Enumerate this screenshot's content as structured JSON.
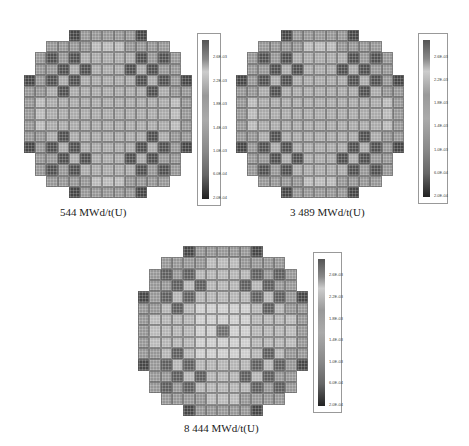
{
  "figure": {
    "panels": [
      {
        "caption": "544 MWd/t(U)",
        "burnup": 544,
        "core": {
          "x": 24,
          "y": 30,
          "size": 168
        },
        "colorbar": {
          "x": 197,
          "y": 33,
          "w": 24,
          "h": 173
        },
        "caption_pos": {
          "x": 60,
          "y": 206
        }
      },
      {
        "caption": "3 489 MWd/t(U)",
        "burnup": 3489,
        "core": {
          "x": 236,
          "y": 30,
          "size": 168
        },
        "colorbar": {
          "x": 418,
          "y": 33,
          "w": 30,
          "h": 171
        },
        "caption_pos": {
          "x": 290,
          "y": 206
        }
      },
      {
        "caption": "8 444  MWd/t(U)",
        "burnup": 8444,
        "core": {
          "x": 138,
          "y": 246,
          "size": 170
        },
        "colorbar": {
          "x": 313,
          "y": 252,
          "w": 29,
          "h": 161
        },
        "caption_pos": {
          "x": 184,
          "y": 422
        }
      }
    ],
    "colorbar_ticks": [
      "2.6E-03",
      "2.2E-03",
      "1.8E-03",
      "1.4E-03",
      "1.0E-03",
      "6.0E-04",
      "2.0E-04"
    ],
    "colorbar_range": [
      0.0002,
      0.0026
    ],
    "grid_size": 15
  }
}
